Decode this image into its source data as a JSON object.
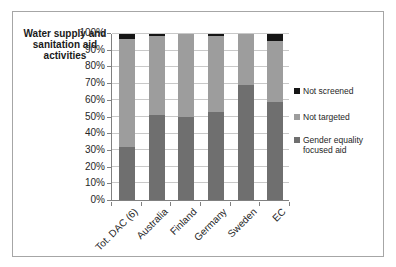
{
  "chart_data": {
    "type": "bar",
    "subtype": "stacked-100-column",
    "title": "Water supply and sanitation aid activities",
    "categories": [
      "Tot. DAC (6)",
      "Australia",
      "Finland",
      "Germany",
      "Sweden",
      "EC"
    ],
    "series": [
      {
        "name": "Gender equality focused aid",
        "color": "#6f6f6f",
        "values": [
          32,
          51,
          50,
          53,
          69,
          59
        ]
      },
      {
        "name": "Not targeted",
        "color": "#9d9d9d",
        "values": [
          65,
          48,
          50,
          46,
          31,
          37
        ]
      },
      {
        "name": "Not screened",
        "color": "#161616",
        "values": [
          3,
          1,
          0,
          1,
          0,
          4
        ]
      }
    ],
    "xlabel": "",
    "ylabel": "",
    "ylim": [
      0,
      100
    ],
    "y_tick_step": 10,
    "y_ticks": [
      "0%",
      "10%",
      "20%",
      "30%",
      "40%",
      "50%",
      "60%",
      "70%",
      "80%",
      "90%",
      "100%"
    ],
    "x_tick_rotation_deg": 45,
    "grid": true,
    "legend_position": "right",
    "legend": [
      {
        "label": "Not screened",
        "color": "#161616"
      },
      {
        "label": "Not targeted",
        "color": "#9d9d9d"
      },
      {
        "label": "Gender equality focused aid",
        "color": "#6f6f6f"
      }
    ],
    "colors": {
      "gridline": "#c8c8c8",
      "axis": "#808080",
      "figure_border": "#a6a6a6",
      "text": "#262626",
      "background": "#ffffff"
    }
  }
}
